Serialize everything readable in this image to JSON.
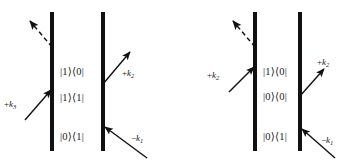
{
  "figure": {
    "kind": "double-sided-feynman-diagrams",
    "background_color": "#ffffff",
    "ink_color": "#111111",
    "diagram_count": 2
  },
  "diagrams": [
    {
      "id": "diagram-left",
      "name": "left-feynman-diagram",
      "bars": [
        {
          "name": "left-ket-bar",
          "x": 52,
          "y_top": 12,
          "y_bottom": 151,
          "width": 4
        },
        {
          "name": "right-bra-bar",
          "x": 103,
          "y_top": 12,
          "y_bottom": 151,
          "width": 4
        }
      ],
      "states": [
        {
          "name": "state-label-top",
          "text": "|1⟩⟨0|",
          "x": 60,
          "y": 72
        },
        {
          "name": "state-label-middle",
          "text": "|1⟩⟨1|",
          "x": 60,
          "y": 98
        },
        {
          "name": "state-label-bottom",
          "text": "|0⟩⟨1|",
          "x": 60,
          "y": 137
        }
      ],
      "arrows": [
        {
          "name": "emission-arrow-dashed",
          "style": "dashed",
          "label": "",
          "label_x": 0,
          "label_y": 0,
          "x1": 52,
          "y1": 47,
          "x2": 29,
          "y2": 20
        },
        {
          "name": "incoming-arrow-k3",
          "style": "solid",
          "label": "+k₃",
          "label_sign": "+",
          "label_sym": "k",
          "label_sub": "3",
          "label_x": 4,
          "label_y": 104,
          "x1": 25,
          "y1": 120,
          "x2": 52,
          "y2": 89
        },
        {
          "name": "outgoing-arrow-k2",
          "style": "solid",
          "label": "+k₂",
          "label_sign": "+",
          "label_sym": "k",
          "label_sub": "2",
          "label_x": 122,
          "label_y": 73,
          "x1": 103,
          "y1": 84,
          "x2": 131,
          "y2": 51
        },
        {
          "name": "incoming-arrow-k1",
          "style": "solid",
          "label": "−k₁",
          "label_sign": "−",
          "label_sym": "k",
          "label_sub": "1",
          "label_x": 131,
          "label_y": 138,
          "x1": 147,
          "y1": 158,
          "x2": 103,
          "y2": 126
        }
      ]
    },
    {
      "id": "diagram-right",
      "name": "right-feynman-diagram",
      "bars": [
        {
          "name": "left-ket-bar",
          "x": 78,
          "y_top": 12,
          "y_bottom": 151,
          "width": 4
        },
        {
          "name": "right-bra-bar",
          "x": 123,
          "y_top": 12,
          "y_bottom": 151,
          "width": 4
        }
      ],
      "states": [
        {
          "name": "state-label-top",
          "text": "|1⟩⟨0|",
          "x": 86,
          "y": 72
        },
        {
          "name": "state-label-middle",
          "text": "|0⟩⟨0|",
          "x": 86,
          "y": 97
        },
        {
          "name": "state-label-bottom",
          "text": "|0⟩⟨1|",
          "x": 86,
          "y": 137
        }
      ],
      "arrows": [
        {
          "name": "emission-arrow-dashed",
          "style": "dashed",
          "label": "",
          "label_x": 0,
          "label_y": 0,
          "x1": 78,
          "y1": 47,
          "x2": 55,
          "y2": 20
        },
        {
          "name": "incoming-arrow-k2",
          "style": "solid",
          "label": "+k₂",
          "label_sign": "+",
          "label_sym": "k",
          "label_sub": "2",
          "label_x": 30,
          "label_y": 75,
          "x1": 52,
          "y1": 92,
          "x2": 78,
          "y2": 66
        },
        {
          "name": "outgoing-arrow-k2",
          "style": "solid",
          "label": "+k₂",
          "label_sign": "+",
          "label_sym": "k",
          "label_sub": "2",
          "label_x": 140,
          "label_y": 62,
          "x1": 123,
          "y1": 96,
          "x2": 148,
          "y2": 68
        },
        {
          "name": "incoming-arrow-k1",
          "style": "solid",
          "label": "−k₁",
          "label_sign": "−",
          "label_sym": "k",
          "label_sub": "1",
          "label_x": 144,
          "label_y": 140,
          "x1": 158,
          "y1": 158,
          "x2": 123,
          "y2": 128
        }
      ]
    }
  ]
}
